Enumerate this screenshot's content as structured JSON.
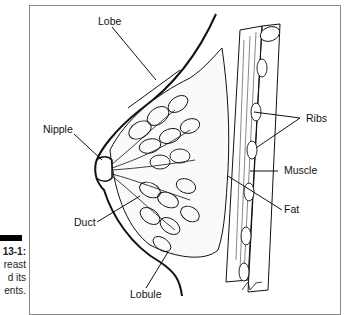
{
  "figure": {
    "caption_number": "13-1:",
    "caption_lines": [
      "reast",
      "d its",
      "ents."
    ]
  },
  "labels": {
    "lobe": "Lobe",
    "nipple": "Nipple",
    "duct": "Duct",
    "lobule": "Lobule",
    "ribs": "Ribs",
    "muscle": "Muscle",
    "fat": "Fat"
  },
  "colors": {
    "ink": "#111111",
    "frame": "#888888",
    "background": "#ffffff"
  }
}
